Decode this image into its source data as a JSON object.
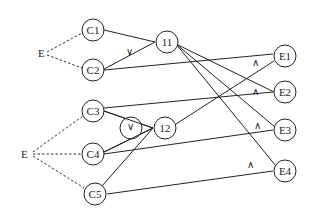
{
  "diagram": {
    "type": "logic-graph",
    "root_labels": [
      {
        "id": "E_top",
        "label": "E",
        "x": 42,
        "y": 53
      },
      {
        "id": "E_bottom",
        "label": "E",
        "x": 28,
        "y": 154
      }
    ],
    "nodes": [
      {
        "id": "C1",
        "label": "C1",
        "x": 93,
        "y": 30
      },
      {
        "id": "C2",
        "label": "C2",
        "x": 93,
        "y": 70
      },
      {
        "id": "C3",
        "label": "C3",
        "x": 93,
        "y": 111
      },
      {
        "id": "C4",
        "label": "C4",
        "x": 93,
        "y": 154
      },
      {
        "id": "C5",
        "label": "C5",
        "x": 95,
        "y": 194
      },
      {
        "id": "11",
        "label": "11",
        "x": 167,
        "y": 42
      },
      {
        "id": "12",
        "label": "12",
        "x": 165,
        "y": 128
      },
      {
        "id": "E1",
        "label": "E1",
        "x": 285,
        "y": 56
      },
      {
        "id": "E2",
        "label": "E2",
        "x": 285,
        "y": 92
      },
      {
        "id": "E3",
        "label": "E3",
        "x": 285,
        "y": 130
      },
      {
        "id": "E4",
        "label": "E4",
        "x": 285,
        "y": 171
      }
    ],
    "dashed_edges": [
      [
        "E_top",
        "C1"
      ],
      [
        "E_top",
        "C2"
      ],
      [
        "E_bottom",
        "C3"
      ],
      [
        "E_bottom",
        "C4"
      ],
      [
        "E_bottom",
        "C5"
      ]
    ],
    "solid_edges": [
      [
        "C1",
        "11"
      ],
      [
        "C2",
        "11"
      ],
      [
        "C3",
        "12"
      ],
      [
        "C4",
        "12"
      ],
      [
        "C5",
        "12"
      ],
      [
        "C2",
        "E1"
      ],
      [
        "C3",
        "E2"
      ],
      [
        "C4",
        "E3"
      ],
      [
        "C5",
        "E4"
      ],
      [
        "12",
        "E1"
      ],
      [
        "11",
        "E2"
      ],
      [
        "11",
        "E3"
      ],
      [
        "11",
        "E4"
      ]
    ],
    "operators": [
      {
        "id": "or_11",
        "symbol": "∨",
        "x": 130,
        "y": 51,
        "circled": false
      },
      {
        "id": "or_12",
        "symbol": "∨",
        "x": 131,
        "y": 128,
        "circled": true
      },
      {
        "id": "and_E1",
        "symbol": "∧",
        "x": 255,
        "y": 62,
        "circled": false
      },
      {
        "id": "and_E2",
        "symbol": "∧",
        "x": 255,
        "y": 91,
        "circled": false
      },
      {
        "id": "and_E3",
        "symbol": "∧",
        "x": 257,
        "y": 125,
        "circled": false
      },
      {
        "id": "and_E4",
        "symbol": "∧",
        "x": 250,
        "y": 164,
        "circled": false
      }
    ]
  }
}
